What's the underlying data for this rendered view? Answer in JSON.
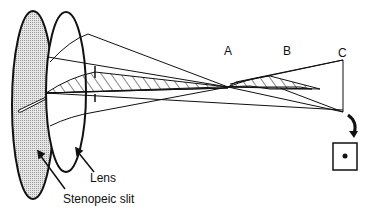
{
  "diagram": {
    "labels": {
      "point_a": "A",
      "point_b": "B",
      "point_c": "C",
      "lens": "Lens",
      "slit": "Stenopeic slit"
    },
    "colors": {
      "stroke": "#111111",
      "slit_fill": "#d9d9d9",
      "background": "#ffffff"
    }
  }
}
